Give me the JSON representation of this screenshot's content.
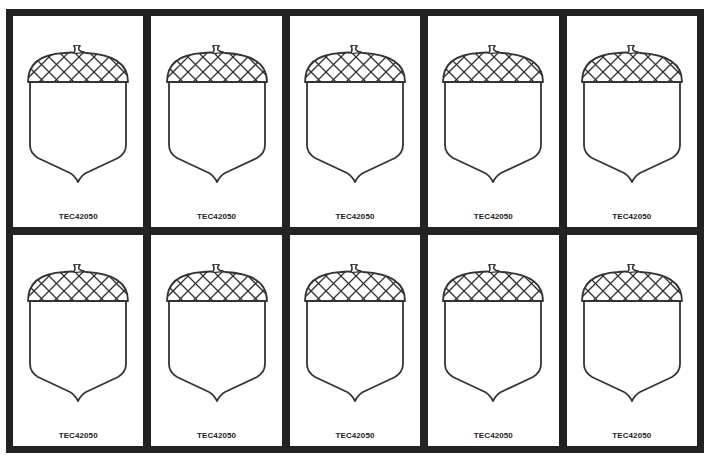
{
  "sheet": {
    "layout": {
      "columns": 5,
      "rows": 2
    },
    "colors": {
      "frame": "#222222",
      "card": "#ffffff",
      "outline": "#333333"
    },
    "cards": [
      {
        "icon": "acorn-icon",
        "label": "TEC42050"
      },
      {
        "icon": "acorn-icon",
        "label": "TEC42050"
      },
      {
        "icon": "acorn-icon",
        "label": "TEC42050"
      },
      {
        "icon": "acorn-icon",
        "label": "TEC42050"
      },
      {
        "icon": "acorn-icon",
        "label": "TEC42050"
      },
      {
        "icon": "acorn-icon",
        "label": "TEC42050"
      },
      {
        "icon": "acorn-icon",
        "label": "TEC42050"
      },
      {
        "icon": "acorn-icon",
        "label": "TEC42050"
      },
      {
        "icon": "acorn-icon",
        "label": "TEC42050"
      },
      {
        "icon": "acorn-icon",
        "label": "TEC42050"
      }
    ]
  }
}
